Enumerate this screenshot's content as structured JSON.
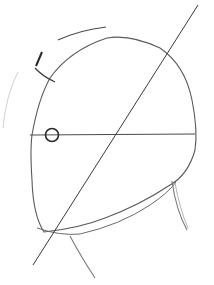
{
  "image": {
    "description": "Pencil sketch of a head construction: oval cranium outline with a diagonal center line, a horizontal brow/eye line, a small circle marking the eye, ear mark, and neck lines.",
    "colors": {
      "background": "#ffffff",
      "stroke_dark": "#3a3a3a",
      "stroke_mid": "#6a6a6a",
      "stroke_light": "#c8c8c8"
    }
  }
}
